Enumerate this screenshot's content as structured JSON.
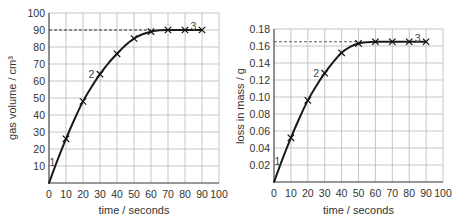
{
  "chart_data": [
    {
      "type": "line",
      "title": "",
      "xlabel": "time / seconds",
      "ylabel": "gas volume / cm³",
      "xlim": [
        0,
        100
      ],
      "ylim": [
        0,
        100
      ],
      "x_ticks": [
        0,
        10,
        20,
        30,
        40,
        50,
        60,
        70,
        80,
        90,
        100
      ],
      "y_ticks": [
        10,
        20,
        30,
        40,
        50,
        60,
        70,
        80,
        90,
        100
      ],
      "x_tick_labels": [
        "0",
        "10",
        "20",
        "30",
        "40",
        "50",
        "60",
        "70",
        "80",
        "90",
        "100"
      ],
      "y_tick_labels": [
        "10",
        "20",
        "30",
        "40",
        "50",
        "60",
        "70",
        "80",
        "90",
        "100"
      ],
      "grid": true,
      "series": [
        {
          "name": "gas volume",
          "x": [
            10,
            20,
            30,
            40,
            50,
            60,
            70,
            80,
            90
          ],
          "y": [
            26,
            48,
            64,
            76,
            85,
            89,
            90,
            90,
            90
          ],
          "marker": "x"
        }
      ],
      "curve": {
        "x": [
          0,
          5,
          10,
          15,
          20,
          25,
          30,
          35,
          40,
          45,
          50,
          55,
          60,
          65,
          70,
          80,
          90
        ],
        "y": [
          0,
          13.5,
          26,
          37.5,
          48,
          56.5,
          64,
          70.5,
          76,
          81,
          85,
          87.5,
          89,
          89.8,
          90,
          90,
          90
        ]
      },
      "reference_line": {
        "y": 90,
        "x_from": 0,
        "x_to": 60,
        "style": "dashed"
      },
      "annotations": [
        {
          "text": "1",
          "x": 2,
          "y": 12
        },
        {
          "text": "2",
          "x": 25,
          "y": 64
        },
        {
          "text": "3",
          "x": 85,
          "y": 92
        }
      ]
    },
    {
      "type": "line",
      "title": "",
      "xlabel": "time / seconds",
      "ylabel": "loss in mass / g",
      "xlim": [
        0,
        100
      ],
      "ylim": [
        0,
        0.18
      ],
      "x_ticks": [
        0,
        10,
        20,
        30,
        40,
        50,
        60,
        70,
        80,
        90,
        100
      ],
      "y_ticks": [
        0.02,
        0.04,
        0.06,
        0.08,
        0.1,
        0.12,
        0.14,
        0.16,
        0.18
      ],
      "x_tick_labels": [
        "0",
        "10",
        "20",
        "30",
        "40",
        "50",
        "60",
        "70",
        "80",
        "90",
        "100"
      ],
      "y_tick_labels": [
        "0.02",
        "0.04",
        "0.06",
        "0.08",
        "0.10",
        "0.12",
        "0.14",
        "0.16",
        "0.18"
      ],
      "grid": true,
      "series": [
        {
          "name": "loss in mass",
          "x": [
            10,
            20,
            30,
            40,
            50,
            60,
            70,
            80,
            90
          ],
          "y": [
            0.052,
            0.096,
            0.128,
            0.152,
            0.163,
            0.165,
            0.165,
            0.165,
            0.165
          ],
          "marker": "x"
        }
      ],
      "curve": {
        "x": [
          0,
          5,
          10,
          15,
          20,
          25,
          30,
          35,
          40,
          45,
          50,
          55,
          60,
          70,
          80,
          90
        ],
        "y": [
          0,
          0.027,
          0.052,
          0.075,
          0.096,
          0.113,
          0.128,
          0.141,
          0.152,
          0.159,
          0.163,
          0.1645,
          0.165,
          0.165,
          0.165,
          0.165
        ]
      },
      "reference_line": {
        "y": 0.165,
        "x_from": 0,
        "x_to": 50,
        "style": "dashed-faint"
      },
      "annotations": [
        {
          "text": "1",
          "x": 2,
          "y": 0.024
        },
        {
          "text": "2",
          "x": 25,
          "y": 0.128
        },
        {
          "text": "3",
          "x": 85,
          "y": 0.169
        }
      ]
    }
  ]
}
